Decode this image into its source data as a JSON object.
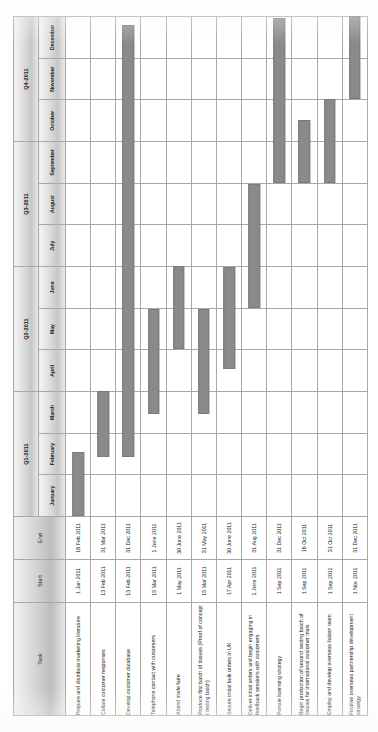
{
  "chart_data": {
    "type": "bar",
    "xlabel": "",
    "ylabel": "",
    "grid": true,
    "orientation": "rotated-90-ccw",
    "columns": [
      "Task",
      "Start",
      "End"
    ],
    "quarters": [
      {
        "label": "Q1-2011",
        "months": [
          "January",
          "February",
          "March"
        ]
      },
      {
        "label": "Q2-2011",
        "months": [
          "April",
          "May",
          "June"
        ]
      },
      {
        "label": "Q3-2011",
        "months": [
          "July",
          "August",
          "September"
        ]
      },
      {
        "label": "Q4-2011",
        "months": [
          "October",
          "November",
          "December"
        ]
      }
    ],
    "months": [
      "January",
      "February",
      "March",
      "April",
      "May",
      "June",
      "July",
      "August",
      "September",
      "October",
      "November",
      "December"
    ],
    "bar_color": "#8a8a8a",
    "categories": [
      "Prepare and distribute marketing literature",
      "Collate customer responses",
      "Develop customer database",
      "Telephone contact with customers",
      "Attend trade faire",
      "Produce first batch of tissues (Proof of concept / testing batch)",
      "Secure initial bulk orders in UK",
      "Deliver initial orders and begin engaging in feedback sessions with customers",
      "Pursue licensing strategy",
      "Begin production of second testing batch of tissues for international customer trials",
      "Employ and develop overseas liaison team",
      "Finalise overseas partnership development strategy"
    ],
    "rows": [
      {
        "task": "Prepare and distribute marketing literature",
        "start": "1 Jan 2011",
        "end": "16 Feb 2011",
        "start_month_index": 0.0,
        "end_month_index": 1.52
      },
      {
        "task": "Collate customer responses",
        "start": "13 Feb 2011",
        "end": "31 Mar 2011",
        "start_month_index": 1.43,
        "end_month_index": 3.0
      },
      {
        "task": "Develop customer database",
        "start": "13 Feb 2011",
        "end": "31 Dec 2011",
        "start_month_index": 1.43,
        "end_month_index": 12.0
      },
      {
        "task": "Telephone contact with customers",
        "start": "15 Mar 2011",
        "end": "1 June 2011",
        "start_month_index": 2.45,
        "end_month_index": 5.0
      },
      {
        "task": "Attend trade faire",
        "start": "1 May 2011",
        "end": "30 June 2011",
        "start_month_index": 4.0,
        "end_month_index": 6.0
      },
      {
        "task": "Produce first batch of tissues (Proof of concept / testing batch)",
        "start": "15 Mar 2011",
        "end": "31 May 2011",
        "start_month_index": 2.45,
        "end_month_index": 5.0
      },
      {
        "task": "Secure initial bulk orders in UK",
        "start": "17 Apr 2011",
        "end": "30 June 2011",
        "start_month_index": 3.53,
        "end_month_index": 6.0
      },
      {
        "task": "Deliver initial orders and begin engaging in feedback sessions with customers",
        "start": "1 June 2011",
        "end": "31 Aug 2011",
        "start_month_index": 5.0,
        "end_month_index": 8.0
      },
      {
        "task": "Pursue licensing strategy",
        "start": "1 Sep 2011",
        "end": "31 Dec 2011",
        "start_month_index": 8.0,
        "end_month_index": 12.0
      },
      {
        "task": "Begin production of second testing batch of tissues for international customer trials",
        "start": "1 Sep 2011",
        "end": "16 Oct 2011",
        "start_month_index": 8.0,
        "end_month_index": 9.5
      },
      {
        "task": "Employ and develop overseas liaison team",
        "start": "1 Sep 2011",
        "end": "31 Oct 2011",
        "start_month_index": 8.0,
        "end_month_index": 10.0
      },
      {
        "task": "Finalise overseas partnership development strategy",
        "start": "1 Nov 2011",
        "end": "31 Dec 2011",
        "start_month_index": 10.0,
        "end_month_index": 12.0
      }
    ]
  }
}
